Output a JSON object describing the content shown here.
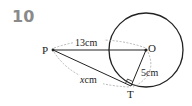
{
  "problem_number": "10",
  "diagram": {
    "points": {
      "P": {
        "label": "P"
      },
      "O": {
        "label": "O"
      },
      "T": {
        "label": "T"
      }
    },
    "measurements": {
      "PO": "13cm",
      "PT": "x cm",
      "PT_var": "x",
      "PT_unit": "cm",
      "OT": "5cm"
    },
    "right_angle_at": "T",
    "colors": {
      "line": "#222222",
      "dashed": "#999999",
      "number": "#8a8a8a"
    }
  }
}
